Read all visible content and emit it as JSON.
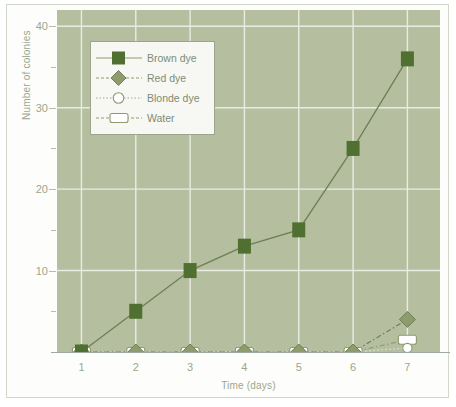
{
  "chart_data": {
    "type": "line",
    "title": "",
    "xlabel": "Time (days)",
    "ylabel": "Number of colonies",
    "x": [
      1,
      2,
      3,
      4,
      5,
      6,
      7
    ],
    "categories": [
      "1",
      "2",
      "3",
      "4",
      "5",
      "6",
      "7"
    ],
    "xlim": [
      0.55,
      7.6
    ],
    "ylim": [
      0,
      42
    ],
    "yticks": [
      10,
      20,
      30,
      40
    ],
    "yticklabels": [
      "10",
      "20",
      "30",
      "40"
    ],
    "yminorticks": [
      5,
      15,
      25,
      35
    ],
    "grid": true,
    "legend_position": "upper left",
    "series": [
      {
        "name": "Brown dye",
        "values": [
          0,
          5,
          10,
          13,
          15,
          25,
          36
        ],
        "marker": "filled-square",
        "linestyle": "solid",
        "color": "#4f7030"
      },
      {
        "name": "Red dye",
        "values": [
          0,
          0,
          0,
          0,
          0,
          0,
          4
        ],
        "marker": "filled-diamond",
        "linestyle": "dash-dot",
        "color": "#8d9b6d"
      },
      {
        "name": "Blonde dye",
        "values": [
          0,
          0,
          0,
          0,
          0,
          0,
          0.5
        ],
        "marker": "open-circle",
        "linestyle": "dotted",
        "color": "#ffffff"
      },
      {
        "name": "Water",
        "values": [
          0,
          0,
          0,
          0,
          0,
          0,
          1.5
        ],
        "marker": "open-rectangle",
        "linestyle": "dash-dot",
        "color": "#ffffff"
      }
    ]
  },
  "legend": {
    "items": [
      {
        "label": "Brown dye"
      },
      {
        "label": "Red dye"
      },
      {
        "label": "Blonde dye"
      },
      {
        "label": "Water"
      }
    ]
  },
  "colors": {
    "plot_background": "#b5bfa0",
    "gridline": "#e8ece1",
    "axis_text": "#9aa78c",
    "brown_dye": "#4f7030",
    "red_dye": "#8d9b6d",
    "open_marker": "#ffffff",
    "page_background": "#ffffff"
  }
}
